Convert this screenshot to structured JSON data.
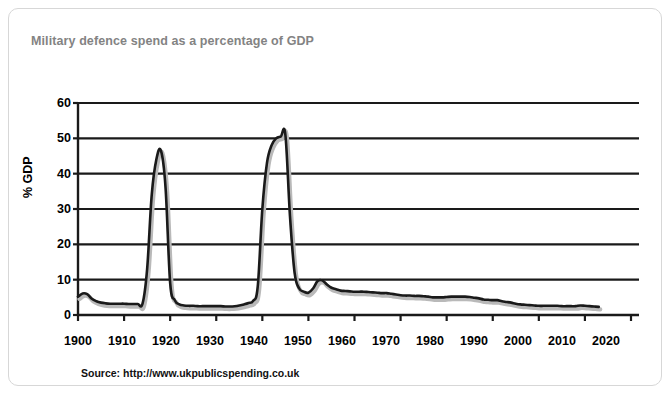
{
  "card": {
    "title": "Military defence spend as a percentage of GDP",
    "source": "Source: http://www.ukpublicspending.co.uk",
    "border_color": "#d7d7d7",
    "title_color": "#838383",
    "background": "#ffffff"
  },
  "chart_data": {
    "type": "line",
    "title": "Military defence spend as a percentage of GDP",
    "subtitle": "",
    "xlabel": "",
    "ylabel": "% GDP",
    "xlim": [
      1900,
      2020
    ],
    "ylim": [
      0,
      60
    ],
    "xticks": [
      1900,
      1910,
      1920,
      1930,
      1940,
      1950,
      1960,
      1970,
      1980,
      1990,
      2000,
      2010,
      2020
    ],
    "yticks": [
      0,
      10,
      20,
      30,
      40,
      50,
      60
    ],
    "xtick_labels": [
      "1900",
      "1910",
      "1920",
      "1930",
      "1940",
      "1950",
      "1960",
      "1970",
      "1980",
      "1990",
      "2000",
      "2010",
      "2020"
    ],
    "ytick_labels": [
      "0",
      "10",
      "20",
      "30",
      "40",
      "50",
      "60"
    ],
    "grid": "horizontal",
    "legend": "none",
    "line_color": "#1a1a1a",
    "line_width": 2.6,
    "series": [
      {
        "name": "Military defence spend (% GDP)",
        "x": [
          1900,
          1901,
          1902,
          1903,
          1904,
          1905,
          1906,
          1907,
          1908,
          1909,
          1910,
          1911,
          1912,
          1913,
          1914,
          1915,
          1916,
          1917,
          1918,
          1919,
          1920,
          1921,
          1922,
          1923,
          1924,
          1925,
          1926,
          1927,
          1928,
          1929,
          1930,
          1931,
          1932,
          1933,
          1934,
          1935,
          1936,
          1937,
          1938,
          1939,
          1940,
          1941,
          1942,
          1943,
          1944,
          1945,
          1946,
          1947,
          1948,
          1949,
          1950,
          1951,
          1952,
          1953,
          1954,
          1955,
          1956,
          1957,
          1958,
          1959,
          1960,
          1961,
          1962,
          1963,
          1964,
          1965,
          1966,
          1967,
          1968,
          1969,
          1970,
          1971,
          1972,
          1973,
          1974,
          1975,
          1976,
          1977,
          1978,
          1979,
          1980,
          1981,
          1982,
          1983,
          1984,
          1985,
          1986,
          1987,
          1988,
          1989,
          1990,
          1991,
          1992,
          1993,
          1994,
          1995,
          1996,
          1997,
          1998,
          1999,
          2000,
          2001,
          2002,
          2003,
          2004,
          2005,
          2006,
          2007,
          2008,
          2009,
          2010,
          2011,
          2012,
          2013
        ],
        "values": [
          5.2,
          6.1,
          5.9,
          4.6,
          3.9,
          3.5,
          3.3,
          3.2,
          3.2,
          3.2,
          3.2,
          3.1,
          3.1,
          3.1,
          3.2,
          13.0,
          34.0,
          44.0,
          46.5,
          36.0,
          9.0,
          4.2,
          3.0,
          2.7,
          2.6,
          2.6,
          2.5,
          2.5,
          2.5,
          2.5,
          2.5,
          2.5,
          2.4,
          2.4,
          2.5,
          2.7,
          3.0,
          3.4,
          4.0,
          8.0,
          30.0,
          43.0,
          48.0,
          50.0,
          50.5,
          51.0,
          28.0,
          12.0,
          7.5,
          6.6,
          6.3,
          7.5,
          9.6,
          9.8,
          8.6,
          7.7,
          7.3,
          6.9,
          6.8,
          6.7,
          6.6,
          6.6,
          6.6,
          6.5,
          6.4,
          6.3,
          6.2,
          6.2,
          6.0,
          5.8,
          5.6,
          5.5,
          5.5,
          5.4,
          5.4,
          5.3,
          5.2,
          5.0,
          5.0,
          5.0,
          5.1,
          5.2,
          5.2,
          5.2,
          5.2,
          5.1,
          4.9,
          4.7,
          4.4,
          4.3,
          4.2,
          4.2,
          3.9,
          3.7,
          3.5,
          3.2,
          3.0,
          2.9,
          2.8,
          2.7,
          2.6,
          2.6,
          2.6,
          2.6,
          2.6,
          2.5,
          2.5,
          2.5,
          2.5,
          2.7,
          2.6,
          2.5,
          2.4,
          2.3
        ],
        "peaks": [
          {
            "label": "Boer War",
            "year": 1901,
            "value": 6.1
          },
          {
            "label": "World War I",
            "year": 1918,
            "value": 46.5
          },
          {
            "label": "World War II",
            "year": 1945,
            "value": 51.0
          },
          {
            "label": "Korean War",
            "year": 1953,
            "value": 9.8
          }
        ]
      }
    ]
  }
}
